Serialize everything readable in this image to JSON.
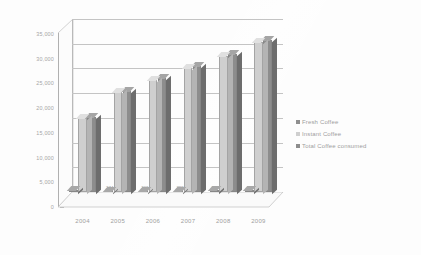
{
  "chart_data": {
    "type": "bar",
    "title": "",
    "subtitle": "",
    "xlabel": "",
    "ylabel": "",
    "categories": [
      "2004",
      "2005",
      "2006",
      "2007",
      "2008",
      "2009"
    ],
    "series": [
      {
        "name": "Fresh Coffee",
        "color": "#8f8f8f",
        "values": [
          307,
          274,
          263,
          299,
          321,
          344
        ]
      },
      {
        "name": "Instant Coffee",
        "color": "#cfcfcf",
        "values": [
          14900,
          20200,
          22700,
          25100,
          27600,
          30300
        ]
      },
      {
        "name": "Total Coffee consumed",
        "color": "#8d8d8d",
        "values": [
          15200,
          20500,
          23000,
          25400,
          27900,
          30700
        ]
      }
    ],
    "data_labels": [
      "307",
      "274",
      "263",
      "299",
      "321",
      "344"
    ],
    "ylim": [
      0,
      35000
    ],
    "ytick_values": [
      0,
      5000,
      10000,
      15000,
      20000,
      25000,
      30000,
      35000
    ],
    "ytick_labels": [
      "0",
      "5,000",
      "10,000",
      "15,000",
      "20,000",
      "25,000",
      "30,000",
      "35,000"
    ],
    "grid": true,
    "legend_position": "right",
    "three_d": true
  },
  "legend": {
    "items": [
      {
        "label": "Fresh Coffee",
        "color": "#8f8f8f"
      },
      {
        "label": "Instant Coffee",
        "color": "#cfcfcf"
      },
      {
        "label": "Total Coffee consumed",
        "color": "#8d8d8d"
      }
    ]
  }
}
